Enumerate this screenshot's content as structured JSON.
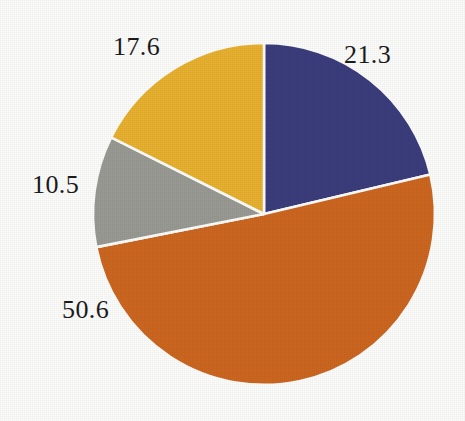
{
  "figure": {
    "background_color": "#fdfdfc",
    "label_color": "#1b1b1b",
    "separator_color": "#fdfdfc",
    "width": 465,
    "height": 421
  },
  "chart_data": {
    "type": "pie",
    "title": "",
    "subtitle": "",
    "xlabel": "",
    "ylabel": "",
    "legend": "none",
    "grid": false,
    "start_angle_deg": 0,
    "direction": "clockwise",
    "total": 100.0,
    "units": "percent",
    "categories": [
      "21.3",
      "50.6",
      "10.5",
      "17.6"
    ],
    "values": [
      21.3,
      50.6,
      10.5,
      17.6
    ],
    "colors": [
      "#3b3d7d",
      "#cd6620",
      "#9a9a95",
      "#e8b130"
    ],
    "slices": [
      {
        "name": "slice-1",
        "label": "21.3",
        "value": 21.3,
        "color": "#3b3d7d",
        "color_name": "navy-blue",
        "start_angle_deg": 0.0,
        "end_angle_deg": 76.68,
        "label_position": "upper-right"
      },
      {
        "name": "slice-2",
        "label": "50.6",
        "value": 50.6,
        "color": "#cd6620",
        "color_name": "orange",
        "start_angle_deg": 76.68,
        "end_angle_deg": 258.84,
        "label_position": "lower-left"
      },
      {
        "name": "slice-3",
        "label": "10.5",
        "value": 10.5,
        "color": "#9a9a95",
        "color_name": "gray",
        "start_angle_deg": 258.84,
        "end_angle_deg": 296.64,
        "label_position": "left"
      },
      {
        "name": "slice-4",
        "label": "17.6",
        "value": 17.6,
        "color": "#e8b130",
        "color_name": "golden-yellow",
        "start_angle_deg": 296.64,
        "end_angle_deg": 360.0,
        "label_position": "upper-left"
      }
    ],
    "geometry": {
      "center_x": 264,
      "center_y": 214,
      "radius": 171
    }
  }
}
